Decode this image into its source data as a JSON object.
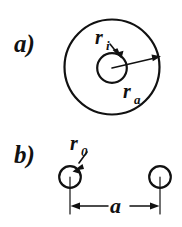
{
  "figure": {
    "background_color": "#ffffff",
    "ink_color": "#111111",
    "width": 182,
    "height": 227,
    "panels": [
      {
        "id": "panel-a",
        "label": "a)",
        "description": "Concentric circles: inner radius r_i and outer radius r_a",
        "labels": [
          {
            "id": "r-inner",
            "base": "r",
            "subscript": "i"
          },
          {
            "id": "r-outer",
            "base": "r",
            "subscript": "a"
          }
        ],
        "geometry": {
          "outer_circle": {
            "cx": 112,
            "cy": 67,
            "r": 48
          },
          "inner_circle": {
            "cx": 112,
            "cy": 68,
            "r": 15
          },
          "radius_arrow_outer": {
            "x1": 112,
            "y1": 68,
            "x2": 159,
            "y2": 57
          },
          "leader_arrow_inner": {
            "x1": 111,
            "y1": 43,
            "x2": 120,
            "y2": 56
          }
        }
      },
      {
        "id": "panel-b",
        "label": "b)",
        "description": "Two equal circles of radius r_0 separated by distance a",
        "labels": [
          {
            "id": "r-zero",
            "base": "r",
            "subscript": "0"
          },
          {
            "id": "separation",
            "base": "a",
            "subscript": ""
          }
        ],
        "geometry": {
          "left_circle": {
            "cx": 70,
            "cy": 177,
            "r": 11
          },
          "right_circle": {
            "cx": 160,
            "cy": 177,
            "r": 11
          },
          "dimension_line": {
            "x1": 70,
            "x2": 160,
            "y": 206
          },
          "extension_left": {
            "x": 70,
            "y1": 177,
            "y2": 214
          },
          "extension_right": {
            "x": 160,
            "y1": 177,
            "y2": 214
          },
          "leader_arrow_r0": {
            "x1": 86,
            "y1": 153,
            "x2": 74,
            "y2": 168
          }
        }
      }
    ]
  }
}
